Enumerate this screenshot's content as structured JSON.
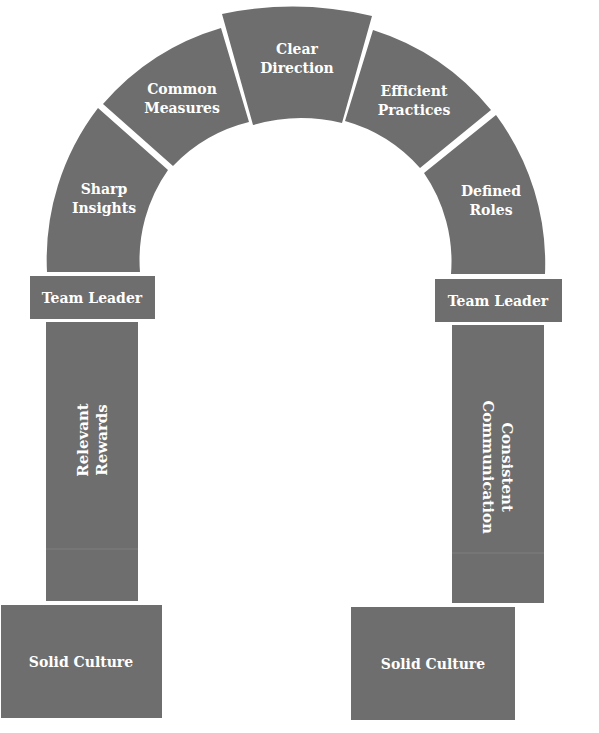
{
  "diagram": {
    "type": "arch",
    "fill_color": "#6e6e6e",
    "text_color": "#ffffff",
    "arch_segments": [
      {
        "line1": "Sharp",
        "line2": "Insights"
      },
      {
        "line1": "Common",
        "line2": "Measures"
      },
      {
        "line1": "Clear",
        "line2": "Direction"
      },
      {
        "line1": "Efficient",
        "line2": "Practices"
      },
      {
        "line1": "Defined",
        "line2": "Roles"
      }
    ],
    "capitals": {
      "left": "Team Leader",
      "right": "Team Leader"
    },
    "pillars": {
      "left": {
        "line1": "Relevant",
        "line2": "Rewards"
      },
      "right": {
        "line1": "Consistent",
        "line2": "Communication"
      }
    },
    "bases": {
      "left": "Solid Culture",
      "right": "Solid Culture"
    }
  }
}
